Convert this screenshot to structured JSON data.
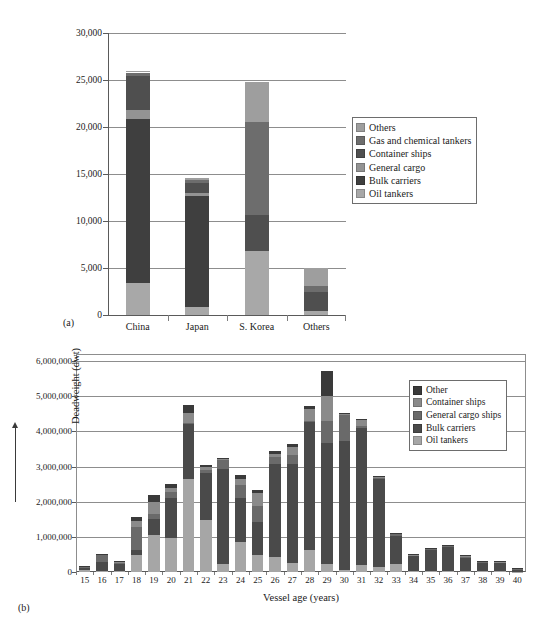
{
  "chart_data": [
    {
      "type": "bar",
      "panel": "(a)",
      "title": "",
      "xlabel": "",
      "ylabel": "",
      "stacked": true,
      "grid": true,
      "legend_position": "right",
      "ylim": [
        0,
        30000
      ],
      "yticks": [
        0,
        5000,
        10000,
        15000,
        20000,
        25000,
        30000
      ],
      "ytick_labels": [
        "0",
        "5,000",
        "10,000",
        "15,000",
        "20,000",
        "25,000",
        "30,000"
      ],
      "categories": [
        "China",
        "Japan",
        "S. Korea",
        "Others"
      ],
      "series": [
        {
          "name": "Oil tankers",
          "color": "#a8a8a8",
          "values": [
            3400,
            900,
            6850,
            450
          ]
        },
        {
          "name": "Bulk carriers",
          "color": "#3f3f3f",
          "values": [
            17500,
            11750,
            0,
            0
          ]
        },
        {
          "name": "General cargo",
          "color": "#939393",
          "values": [
            900,
            350,
            0,
            0
          ]
        },
        {
          "name": "Container ships",
          "color": "#4f4f4f",
          "values": [
            3600,
            1000,
            3800,
            2000
          ]
        },
        {
          "name": "Gas and chemical tankers",
          "color": "#6d6d6d",
          "values": [
            400,
            350,
            9900,
            650
          ]
        },
        {
          "name": "Others",
          "color": "#9e9e9e",
          "values": [
            200,
            200,
            4250,
            1900
          ]
        }
      ],
      "legend_order": [
        "Others",
        "Gas and chemical tankers",
        "Container ships",
        "General cargo",
        "Bulk carriers",
        "Oil tankers"
      ]
    },
    {
      "type": "bar",
      "panel": "(b)",
      "title": "",
      "xlabel": "Vessel age (years)",
      "ylabel": "Deadweight (dwt)",
      "stacked": true,
      "grid": true,
      "legend_position": "upper right",
      "ylim": [
        0,
        6200000
      ],
      "yticks": [
        0,
        1000000,
        2000000,
        3000000,
        4000000,
        5000000,
        6000000
      ],
      "ytick_labels": [
        "0",
        "1,000,000",
        "2,000,000",
        "3,000,000",
        "4,000,000",
        "5,000,000",
        "6,000,000"
      ],
      "categories": [
        "15",
        "16",
        "17",
        "18",
        "19",
        "20",
        "21",
        "22",
        "23",
        "24",
        "25",
        "26",
        "27",
        "28",
        "29",
        "30",
        "31",
        "32",
        "33",
        "34",
        "35",
        "36",
        "37",
        "38",
        "39",
        "40"
      ],
      "series": [
        {
          "name": "Oil tankers",
          "color": "#a6a6a6",
          "values": [
            60000,
            30000,
            40000,
            470000,
            1040000,
            960000,
            2640000,
            1480000,
            240000,
            860000,
            490000,
            440000,
            250000,
            620000,
            230000,
            60000,
            190000,
            130000,
            220000,
            20000,
            20000,
            20000,
            20000,
            20000,
            20000,
            10000
          ]
        },
        {
          "name": "Bulk carriers",
          "color": "#4a4a4a",
          "values": [
            60000,
            250000,
            190000,
            160000,
            480000,
            1140000,
            1570000,
            1340000,
            2700000,
            1250000,
            930000,
            2620000,
            2810000,
            3650000,
            3450000,
            3680000,
            3910000,
            2510000,
            810000,
            430000,
            610000,
            700000,
            400000,
            250000,
            240000,
            80000
          ]
        },
        {
          "name": "General cargo ships",
          "color": "#6a6a6a",
          "values": [
            40000,
            210000,
            50000,
            640000,
            140000,
            180000,
            30000,
            80000,
            240000,
            360000,
            450000,
            200000,
            280000,
            30000,
            620000,
            730000,
            50000,
            50000,
            50000,
            20000,
            20000,
            20000,
            20000,
            20000,
            20000,
            10000
          ]
        },
        {
          "name": "Container ships",
          "color": "#8a8a8a",
          "values": [
            10000,
            10000,
            10000,
            170000,
            330000,
            110000,
            290000,
            90000,
            40000,
            180000,
            380000,
            100000,
            220000,
            330000,
            720000,
            20000,
            180000,
            20000,
            20000,
            20000,
            20000,
            20000,
            20000,
            10000,
            10000,
            10000
          ]
        },
        {
          "name": "Other",
          "color": "#3a3a3a",
          "values": [
            10000,
            10000,
            10000,
            130000,
            190000,
            110000,
            230000,
            40000,
            30000,
            100000,
            70000,
            70000,
            80000,
            90000,
            710000,
            20000,
            30000,
            20000,
            20000,
            10000,
            10000,
            10000,
            10000,
            10000,
            10000,
            10000
          ]
        }
      ],
      "legend_order": [
        "Other",
        "Container ships",
        "General cargo ships",
        "Bulk carriers",
        "Oil tankers"
      ]
    }
  ]
}
